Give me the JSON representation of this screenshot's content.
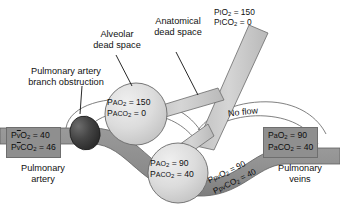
{
  "figure": {
    "type": "physiology-diagram",
    "background_color": "#ffffff",
    "vessel_color": "#8f8f8f",
    "airway_color": "#c9c9c9",
    "alveolus_color": "#d6d6d6",
    "obstruction_color": "#3a3a3a",
    "outline_color": "#555555"
  },
  "callouts": [
    {
      "name": "alveolar-dead-space",
      "line1": "Alveolar",
      "line2": "dead space"
    },
    {
      "name": "anatomical-dead-space",
      "line1": "Anatomical",
      "line2": "dead space"
    },
    {
      "name": "pulmonary-artery-branch-obstruction",
      "line1": "Pulmonary artery",
      "line2": "branch obstruction"
    }
  ],
  "inspired_gas": {
    "name": "inspired-gas-values",
    "o2_symbol_pre": "P",
    "o2_symbol_sub": "I",
    "o2_gas": "O",
    "o2_gas_sub": "2",
    "o2_value": "= 150",
    "co2_symbol_pre": "P",
    "co2_symbol_sub": "I",
    "co2_gas": "CO",
    "co2_gas_sub": "2",
    "co2_value": "= 0",
    "line1_plain": "PIO2 = 150",
    "line2_plain": "PICO2 = 0"
  },
  "alveoli": [
    {
      "name": "alveolus-dead-space",
      "o2_label": "P",
      "o2_sub": "AO",
      "o2_sub2": "2",
      "o2_value": "= 150",
      "co2_label": "P",
      "co2_sub": "ACO",
      "co2_sub2": "2",
      "co2_value": "= 0",
      "line1_plain": "PAO2 = 150",
      "line2_plain": "PACO2 = 0"
    },
    {
      "name": "alveolus-normal",
      "o2_label": "P",
      "o2_sub": "AO",
      "o2_sub2": "2",
      "o2_value": "= 90",
      "co2_label": "P",
      "co2_sub": "ACO",
      "co2_sub2": "2",
      "co2_value": "= 40",
      "line1_plain": "PAO2 = 90",
      "line2_plain": "PACO2 = 40"
    }
  ],
  "mixed_venous": {
    "name": "mixed-venous-values",
    "o2_pre": "P",
    "o2_bar": "v",
    "o2_gas": "O",
    "o2_gas_sub": "2",
    "o2_value": "= 40",
    "co2_pre": "P",
    "co2_bar": "v",
    "co2_gas": "CO",
    "co2_gas_sub": "2",
    "co2_value": "= 46",
    "line1_plain": "PvO2 = 40",
    "line2_plain": "PvCO2 = 46"
  },
  "arterial": {
    "name": "arterial-values",
    "o2_pre": "P",
    "o2_sub": "a",
    "o2_gas": "O",
    "o2_gas_sub": "2",
    "o2_value": "= 90",
    "co2_pre": "P",
    "co2_sub": "a",
    "co2_gas": "CO",
    "co2_gas_sub": "2",
    "co2_value": "= 40",
    "line1_plain": "PaO2 = 90",
    "line2_plain": "PaCO2 = 40"
  },
  "pulmonary_venous_branch": {
    "name": "pulmonary-venous-branch-values",
    "o2_pre": "P",
    "o2_sub": "pv",
    "o2_gas": "O",
    "o2_gas_sub": "2",
    "o2_value": "= 90",
    "co2_pre": "P",
    "co2_sub": "pv",
    "co2_gas": "CO",
    "co2_gas_sub": "2",
    "co2_value": "= 40",
    "line1_plain": "PpvO2 = 90",
    "line2_plain": "PpvCO2 = 40"
  },
  "vessel_names": {
    "artery_line1": "Pulmonary",
    "artery_line2": "artery",
    "veins_line1": "Pulmonary",
    "veins_line2": "veins"
  },
  "annotations": {
    "no_flow": "No flow"
  }
}
